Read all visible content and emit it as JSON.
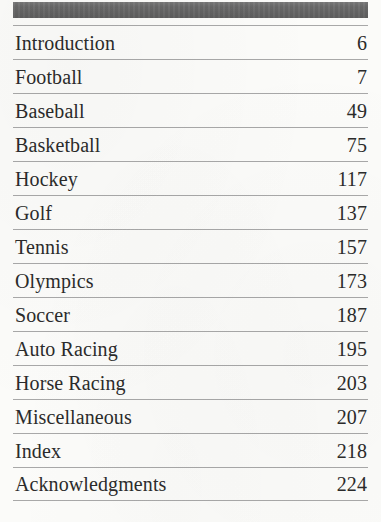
{
  "document": {
    "type": "book-table-of-contents",
    "background_color": "#fbfbf9",
    "text_color": "#2b2b2b",
    "rule_color": "#a8a8a8",
    "header_band_color": "#6a6a6a"
  },
  "contents": {
    "entries": [
      {
        "title": "Introduction",
        "page": "6"
      },
      {
        "title": "Football",
        "page": "7"
      },
      {
        "title": "Baseball",
        "page": "49"
      },
      {
        "title": "Basketball",
        "page": "75"
      },
      {
        "title": "Hockey",
        "page": "117"
      },
      {
        "title": "Golf",
        "page": "137"
      },
      {
        "title": "Tennis",
        "page": "157"
      },
      {
        "title": "Olympics",
        "page": "173"
      },
      {
        "title": "Soccer",
        "page": "187"
      },
      {
        "title": "Auto Racing",
        "page": "195"
      },
      {
        "title": "Horse Racing",
        "page": "203"
      },
      {
        "title": "Miscellaneous",
        "page": "207"
      },
      {
        "title": "Index",
        "page": "218"
      },
      {
        "title": "Acknowledgments",
        "page": "224"
      }
    ]
  }
}
